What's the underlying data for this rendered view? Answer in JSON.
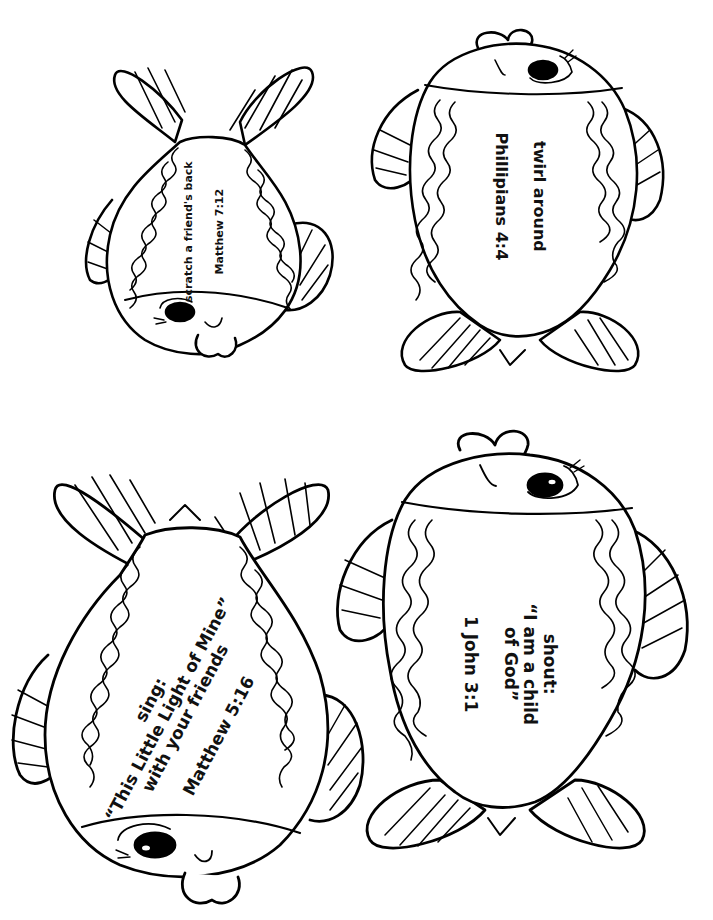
{
  "page": {
    "title": "",
    "background": "#ffffff",
    "ink": "#000000"
  },
  "fish": [
    {
      "id": "fish-top-left",
      "orientation": "head-down",
      "action": [
        "scratch a friend's back"
      ],
      "reference": "Matthew 7:12"
    },
    {
      "id": "fish-top-right",
      "orientation": "head-up",
      "action": [
        "twirl around"
      ],
      "reference": "Phillipians 4:4"
    },
    {
      "id": "fish-bottom-left",
      "orientation": "head-down",
      "action": [
        "sing:",
        "“This Little Light of Mine”",
        "with your friends"
      ],
      "reference": "Matthew 5:16"
    },
    {
      "id": "fish-bottom-right",
      "orientation": "head-up",
      "action": [
        "shout:",
        "“I am a child",
        "of God”"
      ],
      "reference": "1 John 3:1"
    }
  ]
}
